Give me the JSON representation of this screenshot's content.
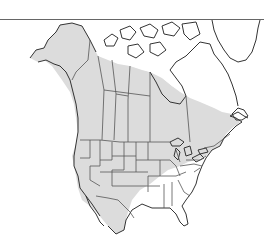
{
  "map": {
    "title": "",
    "region": "North America",
    "type": "species range map",
    "colors": {
      "background": "#ffffff",
      "range": "#dcdcdc",
      "outside_range": "#ffffff",
      "coastline": "#333333",
      "borders": "#555555"
    },
    "range_areas": [
      "Alaska (interior and south)",
      "Western and central Canada",
      "Southern Ontario and Maritimes",
      "Contiguous United States except Southeast",
      "Northern Mexico"
    ],
    "excluded_areas": [
      "Arctic Archipelago",
      "Northern Nunavut / Hudson Bay region",
      "Northern Quebec and Labrador",
      "Southeastern United States",
      "Florida"
    ]
  }
}
